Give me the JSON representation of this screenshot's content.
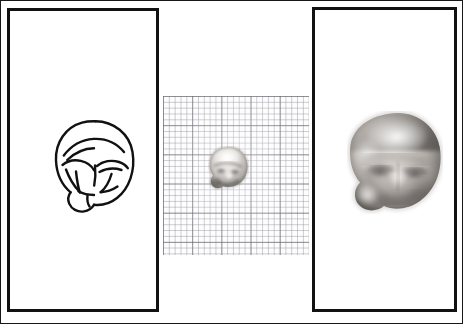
{
  "figure": {
    "background_color": "#ffffff",
    "ink_color": "#121212",
    "frame": {
      "border_color": "#171717",
      "border_width_px": 1
    },
    "width_px": 463,
    "height_px": 324
  },
  "panels": [
    {
      "id": "panel-left",
      "name": "line-drawing-panel",
      "content_type": "line-drawing",
      "caption": "",
      "border_color": "#121212",
      "border_width_px": 3,
      "bounds": {
        "x": 6,
        "y": 7,
        "w": 152,
        "h": 304
      }
    },
    {
      "id": "panel-middle",
      "name": "graph-paper-panel",
      "content_type": "photograph-on-graph-paper",
      "caption": "",
      "border_color": "none",
      "border_width_px": 0,
      "bounds": {
        "x": 162,
        "y": 95,
        "w": 146,
        "h": 159
      }
    },
    {
      "id": "panel-right",
      "name": "magnified-photo-panel",
      "content_type": "photograph",
      "caption": "",
      "border_color": "#121212",
      "border_width_px": 3,
      "bounds": {
        "x": 311,
        "y": 6,
        "w": 145,
        "h": 305
      }
    }
  ],
  "drawing": {
    "name": "fetal-head-line-drawing",
    "subject": "fetal head, frontal view",
    "stroke_color": "#111111",
    "stroke_width_px": 2.4,
    "features": [
      "head outline (oval)",
      "brow ridge",
      "upper eyelid fold left",
      "upper eyelid fold right",
      "nasal bridge",
      "cheek fold left",
      "cheek fold right",
      "chin / jaw lobe"
    ]
  },
  "graph_paper": {
    "name": "millimetre-graph-paper",
    "minor_cell_px": 5.84,
    "major_cell_px": 29.2,
    "minor_lines_per_major": 5,
    "minor_line_color": "#787890",
    "major_line_color": "#5a5a69",
    "paper_color": "#fdfdfd",
    "purpose": "scale reference"
  },
  "specimens": [
    {
      "id": "specimen-small",
      "name": "specimen-actual-size",
      "label": "",
      "magnification": "actual size",
      "bounds": {
        "x": 207,
        "y": 145,
        "w": 41,
        "h": 44
      },
      "tone_light": "#f2f0ee",
      "tone_mid": "#b9b5b2",
      "tone_dark": "#4c4845"
    },
    {
      "id": "specimen-large",
      "name": "specimen-magnified",
      "label": "",
      "magnification": "enlarged",
      "bounds": {
        "x": 346,
        "y": 110,
        "w": 96,
        "h": 103
      },
      "tone_light": "#efece8",
      "tone_mid": "#a9a49f",
      "tone_dark": "#3d3a37"
    }
  ]
}
